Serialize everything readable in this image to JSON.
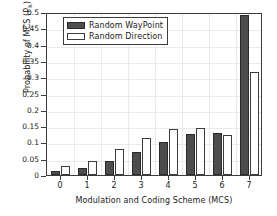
{
  "chart_data": {
    "type": "bar",
    "title": "",
    "xlabel": "Modulation and Coding Scheme (MCS)",
    "ylabel": "Probability of MCS (P",
    "ylabel_sub": "k",
    "ylabel_suffix": ")",
    "categories": [
      "0",
      "1",
      "2",
      "3",
      "4",
      "5",
      "6",
      "7"
    ],
    "series": [
      {
        "name": "Random WayPoint",
        "color": "#4d4d4d",
        "values": [
          0.011,
          0.021,
          0.042,
          0.07,
          0.102,
          0.125,
          0.128,
          0.492
        ]
      },
      {
        "name": "Random Direction",
        "color": "#ffffff",
        "values": [
          0.029,
          0.044,
          0.08,
          0.115,
          0.142,
          0.145,
          0.123,
          0.315
        ]
      }
    ],
    "ylim": [
      0,
      0.5
    ],
    "yticks": [
      "0",
      "0.05",
      "0.1",
      "0.15",
      "0.2",
      "0.25",
      "0.3",
      "0.35",
      "0.4",
      "0.45",
      "0.5"
    ],
    "ytick_values": [
      0,
      0.05,
      0.1,
      0.15,
      0.2,
      0.25,
      0.3,
      0.35,
      0.4,
      0.45,
      0.5
    ],
    "xticks": [
      "0",
      "1",
      "2",
      "3",
      "4",
      "5",
      "6",
      "7"
    ],
    "grid": true,
    "legend_position": "upper-left",
    "legend": [
      "Random WayPoint",
      "Random Direction"
    ]
  },
  "legend": {
    "entries": [
      {
        "label": "Random WayPoint",
        "swatch": "dark"
      },
      {
        "label": "Random Direction",
        "swatch": "light"
      }
    ]
  }
}
